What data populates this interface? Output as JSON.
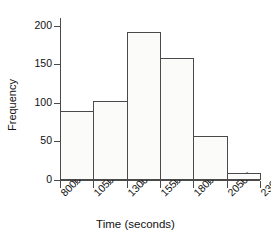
{
  "chart_data": {
    "type": "bar",
    "subtype": "histogram",
    "title": "",
    "xlabel": "Time (seconds)",
    "ylabel": "Frequency",
    "bin_edges": [
      8000,
      10500,
      13000,
      15500,
      18000,
      20500,
      23000
    ],
    "categories": [
      "8000-10500",
      "10500-13000",
      "13000-15500",
      "15500-18000",
      "18000-20500",
      "20500-23000"
    ],
    "values": [
      89,
      103,
      192,
      158,
      57,
      9
    ],
    "xlim": [
      8000,
      23000
    ],
    "ylim": [
      0,
      210
    ],
    "ytick_labels": [
      "0",
      "50",
      "100",
      "150",
      "200"
    ],
    "ytick_values": [
      0,
      50,
      100,
      150,
      200
    ],
    "xtick_labels": [
      "8000",
      "10500",
      "13000",
      "15500",
      "18000",
      "20500",
      "23000"
    ],
    "xtick_values": [
      8000,
      10500,
      13000,
      15500,
      18000,
      20500,
      23000
    ],
    "grid": false,
    "legend": null,
    "bar_face_color": "#fbfbfa",
    "bar_edge_color": "#4a4a4a",
    "axis_color": "#4a4a4a",
    "text_color": "#111111",
    "background_color": "#ffffff",
    "xtick_label_rotation": -45
  }
}
